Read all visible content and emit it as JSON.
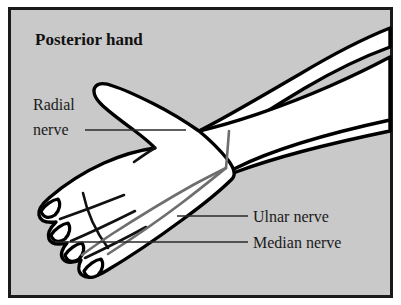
{
  "figure": {
    "title": "Posterior hand",
    "background_color": "#c9c9c9",
    "border_color": "#1a1a1a",
    "skin_fill": "#ffffff",
    "outline_color": "#000000",
    "nerve_color": "#6e6e6e",
    "leader_color": "#2a2a2a",
    "page_color": "#ffffff"
  },
  "labels": {
    "radial_line1": "Radial",
    "radial_line2": "nerve",
    "ulnar": "Ulnar nerve",
    "median": "Median nerve"
  },
  "anatomy": {
    "subject": "posterior-hand-and-forearm",
    "nerves": [
      "radial nerve",
      "ulnar nerve",
      "median nerve"
    ],
    "digit_count": 4,
    "thumb_shown": true
  }
}
